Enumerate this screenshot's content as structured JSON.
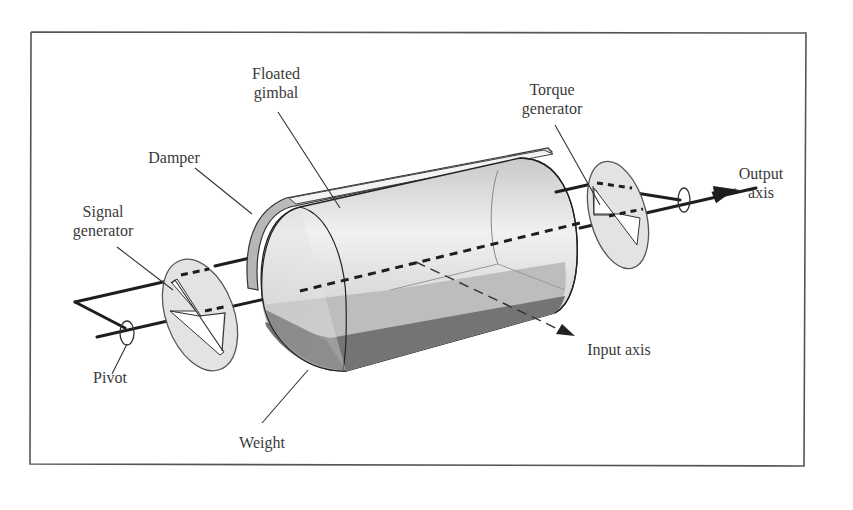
{
  "diagram": {
    "type": "labeled-illustration",
    "labels": {
      "floated_gimbal": {
        "line1": "Floated",
        "line2": "gimbal"
      },
      "damper": {
        "line1": "Damper"
      },
      "signal_generator": {
        "line1": "Signal",
        "line2": "generator"
      },
      "pivot": {
        "line1": "Pivot"
      },
      "weight": {
        "line1": "Weight"
      },
      "input_axis": {
        "line1": "Input axis"
      },
      "torque_generator": {
        "line1": "Torque",
        "line2": "generator"
      },
      "output_axis": {
        "line1": "Output",
        "line2": "axis"
      }
    },
    "colors": {
      "frame": "#555555",
      "cylinder_light": "#e6e6e6",
      "cylinder_mid": "#cfcfcf",
      "fluid": "#bdbdbd",
      "fluid_dark": "#6f6f6f",
      "disc": "#e2e2e2",
      "line": "#1e1e1e"
    }
  }
}
